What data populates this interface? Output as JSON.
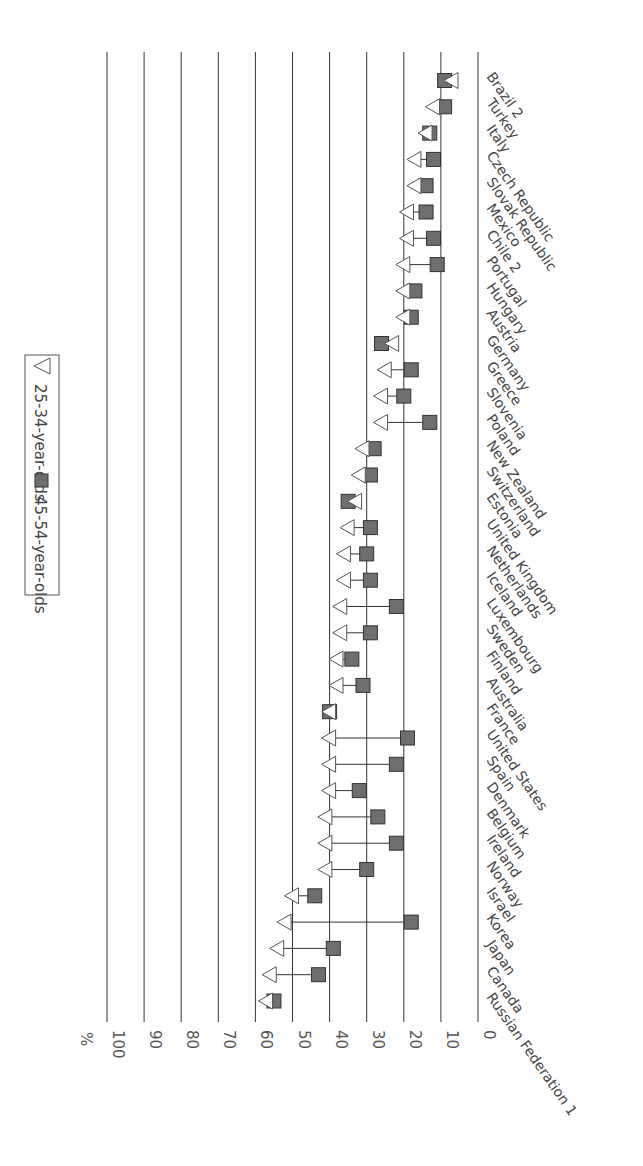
{
  "chart_data": {
    "type": "scatter",
    "subtype": "dot-range (dumbbell) chart, rotated 90°",
    "title": "",
    "ylabel": "%",
    "xlabel": "",
    "value_axis": {
      "min": 0,
      "max": 100,
      "ticks": [
        0,
        10,
        20,
        30,
        40,
        50,
        60,
        70,
        80,
        90,
        100
      ]
    },
    "grid": true,
    "legend": {
      "position": "inside-top",
      "entries": [
        {
          "marker": "triangle-open",
          "label": "25-34-year-olds"
        },
        {
          "marker": "square-filled",
          "label": "45-54-year-olds"
        }
      ]
    },
    "categories": [
      "Russian Federation 1",
      "Canada",
      "Japan",
      "Korea",
      "Israel",
      "Norway",
      "Ireland",
      "Belgium",
      "Denmark",
      "Spain",
      "United States",
      "France",
      "Australia",
      "Finland",
      "Sweden",
      "Luxembourg",
      "Iceland",
      "Netherlands",
      "United Kingdom",
      "Estonia",
      "Switzerland",
      "New Zealand",
      "Poland",
      "Slovenia",
      "Greece",
      "Germany",
      "Austria",
      "Hungary",
      "Portugal",
      "Chile 2",
      "Mexico",
      "Slovak Republic",
      "Czech Republic",
      "Italy",
      "Turkey",
      "Brazil 2"
    ],
    "series": [
      {
        "name": "25-34-year-olds",
        "marker": "triangle",
        "values": [
          57,
          56,
          54,
          52,
          50,
          41,
          41,
          41,
          40,
          40,
          40,
          40,
          38,
          38,
          37,
          37,
          36,
          36,
          35,
          33,
          32,
          31,
          26,
          26,
          25,
          23,
          20,
          20,
          20,
          19,
          19,
          17,
          17,
          14,
          12,
          7
        ]
      },
      {
        "name": "45-54-year-olds",
        "marker": "square",
        "values": [
          55,
          43,
          39,
          18,
          44,
          30,
          22,
          27,
          32,
          22,
          19,
          40,
          31,
          34,
          29,
          22,
          29,
          30,
          29,
          35,
          29,
          28,
          13,
          20,
          18,
          26,
          18,
          17,
          11,
          12,
          14,
          14,
          12,
          13,
          9,
          9
        ]
      }
    ]
  },
  "axis": {
    "unit_label": "%",
    "ticks": [
      "0",
      "10",
      "20",
      "30",
      "40",
      "50",
      "60",
      "70",
      "80",
      "90",
      "100"
    ]
  },
  "legend": {
    "triangle_label": "25-34-year-olds",
    "square_label": "45-54-year-olds"
  },
  "countries": [
    "Russian Federation 1",
    "Canada",
    "Japan",
    "Korea",
    "Israel",
    "Norway",
    "Ireland",
    "Belgium",
    "Denmark",
    "Spain",
    "United States",
    "France",
    "Australia",
    "Finland",
    "Sweden",
    "Luxembourg",
    "Iceland",
    "Netherlands",
    "United Kingdom",
    "Estonia",
    "Switzerland",
    "New Zealand",
    "Poland",
    "Slovenia",
    "Greece",
    "Germany",
    "Austria",
    "Hungary",
    "Portugal",
    "Chile 2",
    "Mexico",
    "Slovak Republic",
    "Czech Republic",
    "Italy",
    "Turkey",
    "Brazil 2"
  ]
}
